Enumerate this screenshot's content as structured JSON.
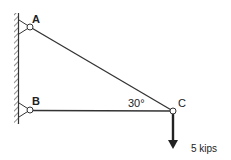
{
  "diagram": {
    "type": "truss",
    "nodes": {
      "A": {
        "label": "A"
      },
      "B": {
        "label": "B"
      },
      "C": {
        "label": "C"
      }
    },
    "angle_label": "30°",
    "load_label": "5 kips",
    "colors": {
      "line": "#333333",
      "background": "#ffffff"
    }
  }
}
